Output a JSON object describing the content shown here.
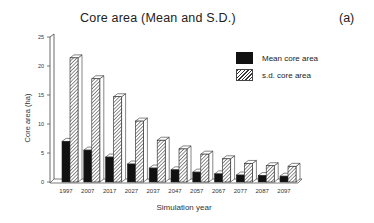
{
  "header": {
    "title": "Core area (Mean and S.D.)",
    "panel_label": "(a)"
  },
  "legend": {
    "items": [
      {
        "label": "Mean core area",
        "style": "solid"
      },
      {
        "label": "s.d. core area",
        "style": "hatched"
      }
    ]
  },
  "axes": {
    "xlabel": "Simulation year",
    "ylabel": "Core area (ha)"
  },
  "chart_data": {
    "type": "bar",
    "title": "Core area (Mean and S.D.)",
    "panel": "(a)",
    "xlabel": "Simulation year",
    "ylabel": "Core area (ha)",
    "ylim": [
      0,
      25
    ],
    "yticks": [
      0,
      5,
      10,
      15,
      20,
      25
    ],
    "grid": false,
    "legend_position": "upper right",
    "style": "3d grouped bar",
    "categories": [
      "1997",
      "2007",
      "2017",
      "2027",
      "2037",
      "2047",
      "2057",
      "2067",
      "2077",
      "2087",
      "2097"
    ],
    "series": [
      {
        "name": "Mean core area",
        "fill": "solid black",
        "values": [
          7.0,
          5.5,
          4.3,
          3.1,
          2.4,
          2.1,
          1.7,
          1.4,
          1.2,
          1.1,
          1.0
        ]
      },
      {
        "name": "s.d. core area",
        "fill": "hatched",
        "values": [
          21.4,
          17.8,
          14.7,
          10.5,
          7.2,
          5.7,
          4.8,
          4.0,
          3.2,
          2.8,
          2.7
        ]
      }
    ]
  }
}
